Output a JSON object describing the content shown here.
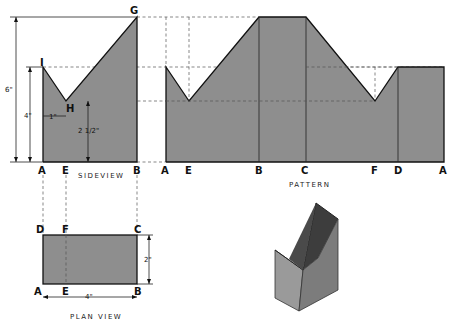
{
  "colors": {
    "fill": "#8e8e8e",
    "line": "#111111",
    "background": "#ffffff"
  },
  "side_view": {
    "caption": "SIDEVIEW",
    "points": {
      "A": "A",
      "E": "E",
      "B": "B",
      "G": "G",
      "I": "I",
      "H": "H"
    },
    "dimensions": {
      "height_total": "6\"",
      "height_left": "4\"",
      "notch_offset": "1\"",
      "notch_height": "2 1/2\""
    }
  },
  "pattern": {
    "caption": "PATTERN",
    "bottom_labels": [
      "A",
      "E",
      "B",
      "C",
      "F",
      "D",
      "A"
    ]
  },
  "plan_view": {
    "caption": "PLAN VIEW",
    "corners": {
      "D": "D",
      "F": "F",
      "C": "C",
      "A": "A",
      "E": "E",
      "B": "B"
    },
    "dimensions": {
      "width": "4\"",
      "depth": "2\""
    }
  },
  "isometric": {
    "description": "3D model of folded box"
  }
}
